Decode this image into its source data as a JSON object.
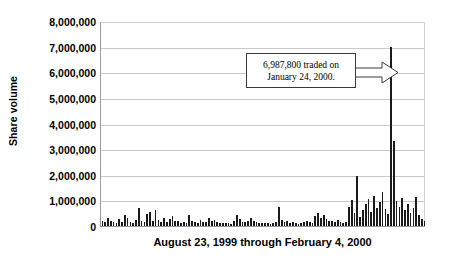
{
  "chart_data": {
    "type": "bar",
    "title": "",
    "xlabel": "August 23, 1999 through February 4, 2000",
    "ylabel": "Share volume",
    "ylim": [
      0,
      8000000
    ],
    "ytick_labels": [
      "8,000,000",
      "7,000,000",
      "6,000,000",
      "5,000,000",
      "4,000,000",
      "3,000,000",
      "2,000,000",
      "1,000,000",
      "0"
    ],
    "ytick_values": [
      8000000,
      7000000,
      6000000,
      5000000,
      4000000,
      3000000,
      2000000,
      1000000,
      0
    ],
    "grid": true,
    "legend": "none",
    "bar_color": "#1a1a1a",
    "annotations": [
      {
        "name": "peak-callout",
        "line1": "6,987,800 traded on",
        "line2": "January 24, 2000.",
        "value": 6987800,
        "points_to_index": 104
      }
    ],
    "values": [
      210000,
      150000,
      330000,
      190000,
      140000,
      120000,
      260000,
      175000,
      420000,
      300000,
      165000,
      130000,
      240000,
      700000,
      210000,
      150000,
      480000,
      560000,
      190000,
      640000,
      230000,
      170000,
      310000,
      145000,
      260000,
      390000,
      180000,
      210000,
      130000,
      150000,
      120000,
      440000,
      195000,
      160000,
      110000,
      230000,
      175000,
      140000,
      300000,
      210000,
      250000,
      160000,
      120000,
      135000,
      100000,
      115000,
      95000,
      180000,
      430000,
      260000,
      170000,
      145000,
      190000,
      300000,
      210000,
      160000,
      125000,
      110000,
      135000,
      100000,
      90000,
      115000,
      140000,
      760000,
      230000,
      175000,
      190000,
      120000,
      150000,
      105000,
      95000,
      130000,
      160000,
      200000,
      140000,
      115000,
      390000,
      520000,
      300000,
      440000,
      260000,
      210000,
      180000,
      150000,
      230000,
      165000,
      120000,
      140000,
      760000,
      1030000,
      520000,
      1950000,
      350000,
      620000,
      870000,
      1040000,
      560000,
      1180000,
      720000,
      940000,
      1320000,
      680000,
      450000,
      6987800,
      3300000,
      980000,
      760000,
      1080000,
      620000,
      840000,
      520000,
      700000,
      1150000,
      430000,
      260000,
      180000
    ]
  }
}
